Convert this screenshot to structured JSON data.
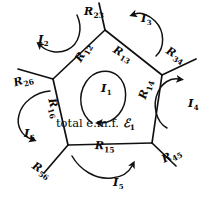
{
  "figure": {
    "stroke_color": "#111111",
    "background": "#ffffff",
    "center_text": {
      "prefix": "total e.m.f. ",
      "symbol": "ℰ",
      "subscript": "1"
    }
  },
  "resistors": [
    {
      "name": "R23",
      "base": "R",
      "sub": "23",
      "x": 84,
      "y": 6,
      "rot_class": "rot23"
    },
    {
      "name": "R13",
      "base": "R",
      "sub": "13",
      "x": 117,
      "y": 44,
      "rot_class": "rot13"
    },
    {
      "name": "R34",
      "base": "R",
      "sub": "34",
      "x": 170,
      "y": 45,
      "rot_class": "rot34"
    },
    {
      "name": "R12",
      "base": "R",
      "sub": "12",
      "x": 73,
      "y": 58,
      "rot_class": "rot12"
    },
    {
      "name": "R26",
      "base": "R",
      "sub": "26",
      "x": 12,
      "y": 78,
      "rot_class": "rot26"
    },
    {
      "name": "R16",
      "base": "R",
      "sub": "16",
      "x": 57,
      "y": 97,
      "rot_class": "rot16"
    },
    {
      "name": "R14",
      "base": "R",
      "sub": "14",
      "x": 137,
      "y": 97,
      "rot_class": "rot14"
    },
    {
      "name": "R15",
      "base": "R",
      "sub": "15",
      "x": 95,
      "y": 140,
      "rot_class": "rot15"
    },
    {
      "name": "R56",
      "base": "R",
      "sub": "56",
      "x": 36,
      "y": 160,
      "rot_class": "rot56"
    },
    {
      "name": "R45",
      "base": "R",
      "sub": "45",
      "x": 160,
      "y": 155,
      "rot_class": "rot45"
    }
  ],
  "currents": [
    {
      "name": "I1",
      "base": "I",
      "sub": "1",
      "x": 101,
      "y": 83
    },
    {
      "name": "I2",
      "base": "I",
      "sub": "2",
      "x": 38,
      "y": 34
    },
    {
      "name": "I3",
      "base": "I",
      "sub": "3",
      "x": 141,
      "y": 13
    },
    {
      "name": "I4",
      "base": "I",
      "sub": "4",
      "x": 188,
      "y": 98
    },
    {
      "name": "I5",
      "base": "I",
      "sub": "5",
      "x": 113,
      "y": 177
    },
    {
      "name": "I6",
      "base": "I",
      "sub": "6",
      "x": 24,
      "y": 128
    }
  ],
  "nodes": [
    {
      "name": "node-top",
      "x": 105,
      "y": 30
    },
    {
      "name": "node-upper-left",
      "x": 53,
      "y": 79
    },
    {
      "name": "node-upper-right",
      "x": 162,
      "y": 75
    },
    {
      "name": "node-lower-left",
      "x": 68,
      "y": 145
    },
    {
      "name": "node-lower-right",
      "x": 152,
      "y": 143
    }
  ],
  "stubs": [
    {
      "name": "stub-R23-top",
      "from": "node-top",
      "to_x": 99,
      "to_y": 3
    },
    {
      "name": "stub-R26-left",
      "from": "node-upper-left",
      "to_x": 18,
      "to_y": 69
    },
    {
      "name": "stub-R34-right",
      "from": "node-upper-right",
      "to_x": 196,
      "to_y": 59
    },
    {
      "name": "stub-R56-bl",
      "from": "node-lower-left",
      "to_x": 44,
      "to_y": 173
    },
    {
      "name": "stub-R45-br",
      "from": "node-lower-right",
      "to_x": 176,
      "to_y": 166
    }
  ]
}
